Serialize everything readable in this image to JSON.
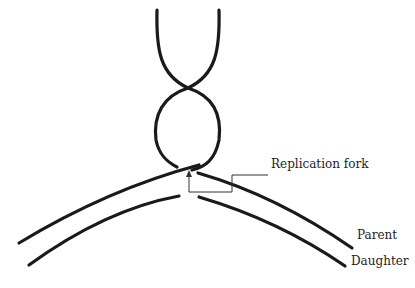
{
  "diagram": {
    "labels": {
      "replication_fork": "Replication fork",
      "parent": "Parent",
      "daughter": "Daughter"
    },
    "colors": {
      "strand": "#1a1a1a",
      "pointer": "#333333",
      "background": "#ffffff"
    }
  }
}
